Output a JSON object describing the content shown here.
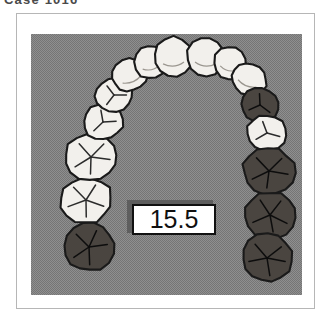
{
  "caption": {
    "text": "Case 1016",
    "note": "cropped at top edge, only lower stroke sliver visible"
  },
  "figure": {
    "name": "maxillary-dental-arch",
    "background_color": "#8f8f8f",
    "frame_color": "#b6b6b6",
    "page_color": "#ffffff"
  },
  "measurement": {
    "value": "15.5",
    "box_fill": "#ffffff",
    "box_border": "#111111",
    "shadow_color": "#5e5e5e",
    "text_color": "#101010"
  },
  "palette": {
    "tooth_light_fill": "#f2f0ec",
    "tooth_dark_fill": "#4a4540",
    "tooth_outline": "#1a1a1a",
    "groove_line": "#2b2b2b"
  },
  "arch": {
    "description": "Occlusal view of upper dental arch, 14 teeth, anterior at top",
    "teeth": [
      {
        "id": "UL3M",
        "label": "upper-left-third-molar",
        "side": "left",
        "type": "molar",
        "shaded": true,
        "cx": 58,
        "cy": 213,
        "rx": 25,
        "ry": 24,
        "rot": -8,
        "grooves": "molar"
      },
      {
        "id": "UL2M",
        "label": "upper-left-second-molar",
        "side": "left",
        "type": "molar",
        "shaded": false,
        "cx": 55,
        "cy": 166,
        "rx": 26,
        "ry": 23,
        "rot": -6,
        "grooves": "molar"
      },
      {
        "id": "UL1M",
        "label": "upper-left-first-molar",
        "side": "left",
        "type": "molar",
        "shaded": false,
        "cx": 60,
        "cy": 123,
        "rx": 26,
        "ry": 23,
        "rot": -4,
        "grooves": "molar"
      },
      {
        "id": "UL2P",
        "label": "upper-left-second-premolar",
        "side": "left",
        "type": "premolar",
        "shaded": false,
        "cx": 72,
        "cy": 88,
        "rx": 20,
        "ry": 18,
        "rot": -8,
        "grooves": "premolar"
      },
      {
        "id": "UL1P",
        "label": "upper-left-first-premolar",
        "side": "left",
        "type": "premolar",
        "shaded": false,
        "cx": 83,
        "cy": 61,
        "rx": 19,
        "ry": 17,
        "rot": -14,
        "grooves": "premolar"
      },
      {
        "id": "UL C",
        "label": "upper-left-canine",
        "side": "left",
        "type": "canine",
        "shaded": false,
        "cx": 99,
        "cy": 41,
        "rx": 18,
        "ry": 16,
        "rot": -22,
        "grooves": "none"
      },
      {
        "id": "UL LI",
        "label": "upper-left-lateral-incisor",
        "side": "left",
        "type": "incisor",
        "shaded": false,
        "cx": 119,
        "cy": 28,
        "rx": 16,
        "ry": 17,
        "rot": -14,
        "grooves": "none"
      },
      {
        "id": "UL CI",
        "label": "upper-left-central-incisor",
        "side": "left",
        "type": "incisor",
        "shaded": false,
        "cx": 142,
        "cy": 23,
        "rx": 19,
        "ry": 20,
        "rot": -5,
        "grooves": "none"
      },
      {
        "id": "UR CI",
        "label": "upper-right-central-incisor",
        "side": "right",
        "type": "incisor",
        "shaded": false,
        "cx": 175,
        "cy": 23,
        "rx": 19,
        "ry": 20,
        "rot": 5,
        "grooves": "none"
      },
      {
        "id": "UR LI",
        "label": "upper-right-lateral-incisor",
        "side": "right",
        "type": "incisor",
        "shaded": false,
        "cx": 199,
        "cy": 29,
        "rx": 16,
        "ry": 17,
        "rot": 14,
        "grooves": "none"
      },
      {
        "id": "UR C",
        "label": "upper-right-canine",
        "side": "right",
        "type": "canine",
        "shaded": false,
        "cx": 218,
        "cy": 45,
        "rx": 18,
        "ry": 16,
        "rot": 22,
        "grooves": "none"
      },
      {
        "id": "UR1P",
        "label": "upper-right-first-premolar",
        "side": "right",
        "type": "premolar",
        "shaded": true,
        "cx": 229,
        "cy": 71,
        "rx": 19,
        "ry": 17,
        "rot": 14,
        "grooves": "premolar"
      },
      {
        "id": "UR2P",
        "label": "upper-right-second-premolar",
        "side": "right",
        "type": "premolar",
        "shaded": false,
        "cx": 236,
        "cy": 99,
        "rx": 20,
        "ry": 18,
        "rot": 8,
        "grooves": "premolar"
      },
      {
        "id": "UR1M",
        "label": "upper-right-first-molar",
        "side": "right",
        "type": "molar",
        "shaded": true,
        "cx": 238,
        "cy": 137,
        "rx": 26,
        "ry": 23,
        "rot": 4,
        "grooves": "molar"
      },
      {
        "id": "UR2M",
        "label": "upper-right-second-molar",
        "side": "right",
        "type": "molar",
        "shaded": true,
        "cx": 239,
        "cy": 181,
        "rx": 26,
        "ry": 23,
        "rot": 6,
        "grooves": "molar"
      },
      {
        "id": "UR3M",
        "label": "upper-right-third-molar",
        "side": "right",
        "type": "molar",
        "shaded": true,
        "cx": 236,
        "cy": 224,
        "rx": 25,
        "ry": 24,
        "rot": 8,
        "grooves": "molar"
      }
    ]
  }
}
